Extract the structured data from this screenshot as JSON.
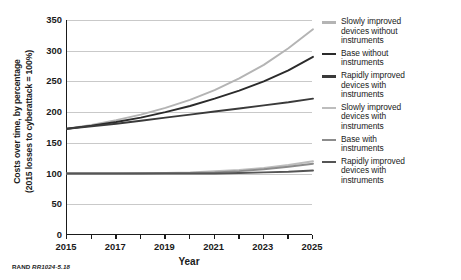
{
  "chart_data": {
    "type": "line",
    "title": "",
    "xlabel": "Year",
    "ylabel": "Costs over time, by percentage (2015 losses to cyberattack = 100%)",
    "ylabel_line1": "Costs over time, by percentage",
    "ylabel_line2": "(2015 losses to cyberattack = 100%)",
    "xlim": [
      2015,
      2025
    ],
    "ylim": [
      0,
      350
    ],
    "yticks": [
      0,
      50,
      100,
      150,
      200,
      250,
      300,
      350
    ],
    "ytick_labels": [
      "0",
      "50",
      "100",
      "150",
      "200",
      "250",
      "300",
      "350"
    ],
    "xticks": [
      2015,
      2016,
      2017,
      2018,
      2019,
      2020,
      2021,
      2022,
      2023,
      2024,
      2025
    ],
    "xtick_labels": [
      "2015",
      "2017",
      "2019",
      "2021",
      "2023",
      "2025"
    ],
    "xtick_labeled_values": [
      2015,
      2017,
      2019,
      2021,
      2023,
      2025
    ],
    "grid": "horizontal",
    "legend_position": "right",
    "x": [
      2015,
      2016,
      2017,
      2018,
      2019,
      2020,
      2021,
      2022,
      2023,
      2024,
      2025
    ],
    "series": [
      {
        "name": "Slowly improved devices without instruments",
        "color": "#b4b4b4",
        "values": [
          173,
          179,
          187,
          196,
          207,
          220,
          236,
          255,
          277,
          304,
          335
        ]
      },
      {
        "name": "Base without instruments",
        "color": "#2b2b2b",
        "values": [
          173,
          178,
          184,
          191,
          200,
          210,
          222,
          235,
          250,
          268,
          290
        ]
      },
      {
        "name": "Rapidly improved devices with instruments",
        "color": "#3a3a3a",
        "values": [
          173,
          177,
          181,
          186,
          191,
          196,
          201,
          206,
          211,
          216,
          222
        ]
      },
      {
        "name": "Slowly improved devices with instruments",
        "color": "#bdbdbd",
        "values": [
          100,
          100,
          100,
          101,
          101,
          102,
          104,
          106,
          109,
          114,
          120
        ]
      },
      {
        "name": "Base with instruments",
        "color": "#8c8c8c",
        "values": [
          100,
          100,
          100,
          100,
          101,
          101,
          102,
          104,
          107,
          111,
          116
        ]
      },
      {
        "name": "Rapidly improved devices with instruments",
        "color": "#555555",
        "values": [
          100,
          100,
          100,
          100,
          100,
          100,
          100,
          101,
          102,
          103,
          105
        ]
      }
    ]
  },
  "legend": {
    "items": [
      {
        "label_lines": [
          "Slowly improved",
          "devices without",
          "instruments"
        ],
        "color": "#b4b4b4"
      },
      {
        "label_lines": [
          "Base without",
          "instruments"
        ],
        "color": "#2b2b2b"
      },
      {
        "label_lines": [
          "Rapidly improved",
          "devices with",
          "instruments"
        ],
        "color": "#3a3a3a"
      },
      {
        "label_lines": [
          "Slowly improved",
          "devices with",
          "instruments"
        ],
        "color": "#bdbdbd"
      },
      {
        "label_lines": [
          "Base with",
          "instruments"
        ],
        "color": "#8c8c8c"
      },
      {
        "label_lines": [
          "Rapidly improved",
          "devices with",
          "instruments"
        ],
        "color": "#555555"
      }
    ]
  },
  "source_note": {
    "prefix": "RAND ",
    "id": "RR1024-5.18"
  }
}
